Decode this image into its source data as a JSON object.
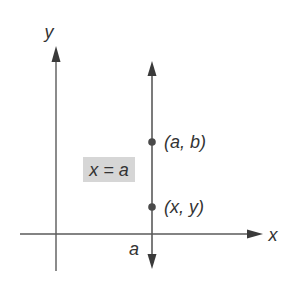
{
  "diagram": {
    "type": "coordinate-plane",
    "axes": {
      "x_label": "x",
      "y_label": "y"
    },
    "vertical_line": {
      "equation_label": "x = a",
      "intercept_label": "a"
    },
    "points": [
      {
        "label": "(a, b)"
      },
      {
        "label": "(x, y)"
      }
    ],
    "colors": {
      "stroke": "#5a5a5a",
      "text": "#333333",
      "label_box": "#d6d6d6"
    }
  }
}
